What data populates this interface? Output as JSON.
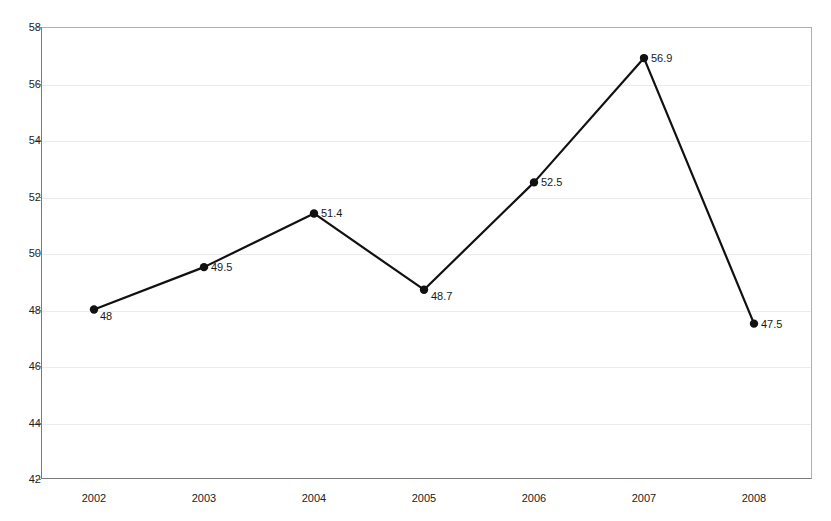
{
  "chart_data": {
    "type": "line",
    "title": "",
    "subtitle": "",
    "xlabel": "",
    "ylabel": "",
    "categories": [
      "2002",
      "2003",
      "2004",
      "2005",
      "2006",
      "2007",
      "2008"
    ],
    "values": [
      48,
      49.5,
      51.4,
      48.7,
      52.5,
      56.9,
      47.5
    ],
    "point_labels": [
      "48",
      "49.5",
      "51.4",
      "48.7",
      "52.5",
      "56.9",
      "47.5"
    ],
    "series": [
      {
        "name": "",
        "values": [
          48,
          49.5,
          51.4,
          48.7,
          52.5,
          56.9,
          47.5
        ]
      }
    ],
    "ylim": [
      42,
      58
    ],
    "xlim": [
      "2002",
      "2008"
    ],
    "y_ticks": [
      42,
      44,
      46,
      48,
      50,
      52,
      54,
      56,
      58
    ],
    "y_tick_labels": [
      "42",
      "44",
      "46",
      "48",
      "50",
      "52",
      "54",
      "56",
      "58"
    ],
    "x_tick_labels": [
      "2002",
      "2003",
      "2004",
      "2005",
      "2006",
      "2007",
      "2008"
    ],
    "grid": "horizontal-only",
    "legend": "none",
    "legend_position": "none",
    "line_color": "#111111",
    "marker_color": "#111111",
    "marker_shape": "circle",
    "gridline_color": "#ececec",
    "axis_color": "#7a7a7a",
    "background_color": "#ffffff",
    "text_color": "#1a1a1a"
  }
}
